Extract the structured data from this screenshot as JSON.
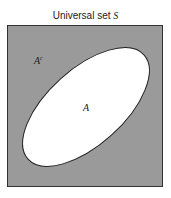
{
  "diagram": {
    "type": "venn",
    "title": "Universal set",
    "title_symbol": "S",
    "universe_fill": "#9a9a9a",
    "set_fill": "#ffffff",
    "sets": [
      {
        "label": "A"
      }
    ],
    "complement_label": "A",
    "complement_superscript": "c"
  }
}
